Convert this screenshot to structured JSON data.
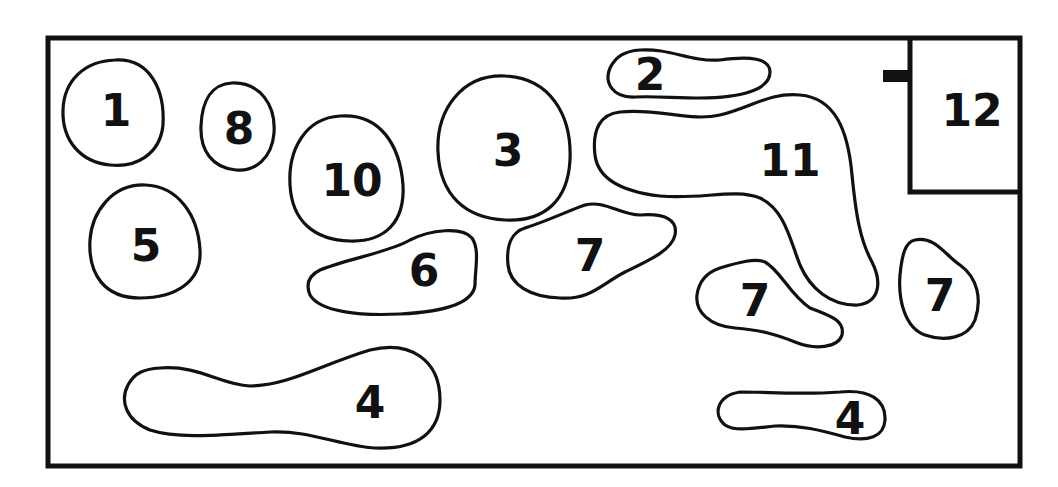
{
  "diagram": {
    "colors": {
      "stroke": "#111111",
      "background": "#ffffff"
    },
    "room": {
      "label": "12"
    },
    "areas": [
      {
        "id": "area-1",
        "label": "1"
      },
      {
        "id": "area-2",
        "label": "2"
      },
      {
        "id": "area-3",
        "label": "3"
      },
      {
        "id": "area-4a",
        "label": "4"
      },
      {
        "id": "area-4b",
        "label": "4"
      },
      {
        "id": "area-5",
        "label": "5"
      },
      {
        "id": "area-6",
        "label": "6"
      },
      {
        "id": "area-7a",
        "label": "7"
      },
      {
        "id": "area-7b",
        "label": "7"
      },
      {
        "id": "area-8",
        "label": "8"
      },
      {
        "id": "area-9",
        "label": "9"
      },
      {
        "id": "area-10",
        "label": "10"
      },
      {
        "id": "area-11",
        "label": "11"
      }
    ]
  }
}
